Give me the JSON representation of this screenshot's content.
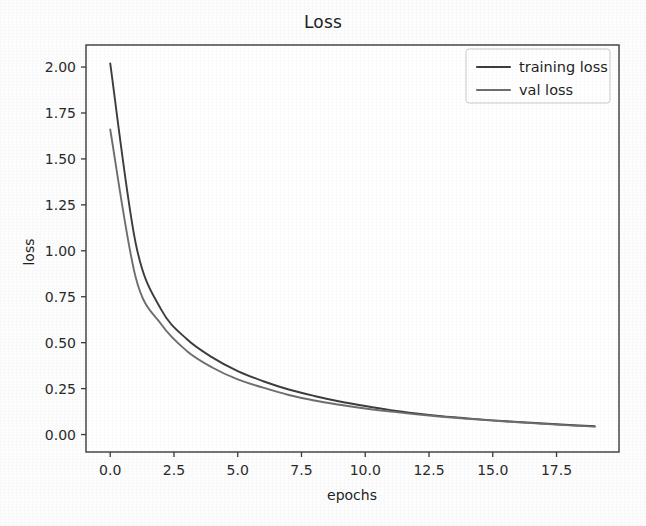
{
  "chart_data": {
    "type": "line",
    "title": "Loss",
    "xlabel": "epochs",
    "ylabel": "loss",
    "xlim": [
      -0.95,
      19.95
    ],
    "ylim": [
      -0.095,
      2.12
    ],
    "grid": false,
    "legend_position": "upper right",
    "x_ticks": [
      "0.0",
      "2.5",
      "5.0",
      "7.5",
      "10.0",
      "12.5",
      "15.0",
      "17.5"
    ],
    "x_tick_values": [
      0.0,
      2.5,
      5.0,
      7.5,
      10.0,
      12.5,
      15.0,
      17.5
    ],
    "y_ticks": [
      "0.00",
      "0.25",
      "0.50",
      "0.75",
      "1.00",
      "1.25",
      "1.50",
      "1.75",
      "2.00"
    ],
    "y_tick_values": [
      0.0,
      0.25,
      0.5,
      0.75,
      1.0,
      1.25,
      1.5,
      1.75,
      2.0
    ],
    "x": [
      0,
      1,
      2,
      3,
      4,
      5,
      6,
      7,
      8,
      9,
      10,
      11,
      12,
      13,
      14,
      15,
      16,
      17,
      18,
      19
    ],
    "series": [
      {
        "name": "training loss",
        "color": "#3d3d3d",
        "values": [
          2.02,
          1.04,
          0.68,
          0.52,
          0.42,
          0.345,
          0.29,
          0.245,
          0.21,
          0.18,
          0.155,
          0.133,
          0.115,
          0.1,
          0.088,
          0.077,
          0.068,
          0.06,
          0.052,
          0.045
        ]
      },
      {
        "name": "val loss",
        "color": "#6e6e6e",
        "values": [
          1.66,
          0.855,
          0.6,
          0.455,
          0.365,
          0.3,
          0.255,
          0.215,
          0.185,
          0.162,
          0.142,
          0.125,
          0.11,
          0.097,
          0.086,
          0.076,
          0.067,
          0.058,
          0.05,
          0.043
        ]
      }
    ]
  },
  "legend": {
    "entries": [
      {
        "label": "training loss"
      },
      {
        "label": "val loss"
      }
    ]
  },
  "figure": {
    "background_color": "#fdfdfd",
    "axes_color": "#3a3a3a"
  }
}
